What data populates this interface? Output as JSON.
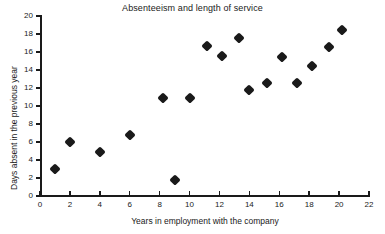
{
  "chart_data": {
    "type": "scatter",
    "title": "Absenteeism and length of service",
    "xlabel": "Years in employment with the company",
    "ylabel": "Days absent in the previous year",
    "xlim": [
      0,
      22
    ],
    "ylim": [
      0,
      20
    ],
    "xticks": [
      0,
      2,
      4,
      6,
      8,
      10,
      12,
      14,
      16,
      18,
      20,
      22
    ],
    "yticks": [
      0,
      2,
      4,
      6,
      8,
      10,
      12,
      14,
      16,
      18,
      20
    ],
    "grid": false,
    "legend": false,
    "marker": "diamond",
    "marker_color": "#1a1a1a",
    "points": [
      {
        "x": 1.0,
        "y": 3.0
      },
      {
        "x": 2.0,
        "y": 6.0
      },
      {
        "x": 4.0,
        "y": 4.9
      },
      {
        "x": 6.0,
        "y": 6.8
      },
      {
        "x": 8.2,
        "y": 10.9
      },
      {
        "x": 9.0,
        "y": 1.8
      },
      {
        "x": 10.0,
        "y": 10.9
      },
      {
        "x": 11.2,
        "y": 16.7
      },
      {
        "x": 12.2,
        "y": 15.6
      },
      {
        "x": 13.3,
        "y": 17.6
      },
      {
        "x": 14.0,
        "y": 11.8
      },
      {
        "x": 15.2,
        "y": 12.6
      },
      {
        "x": 16.2,
        "y": 15.5
      },
      {
        "x": 17.2,
        "y": 12.6
      },
      {
        "x": 18.2,
        "y": 14.5
      },
      {
        "x": 19.3,
        "y": 16.6
      },
      {
        "x": 20.2,
        "y": 18.5
      }
    ]
  }
}
